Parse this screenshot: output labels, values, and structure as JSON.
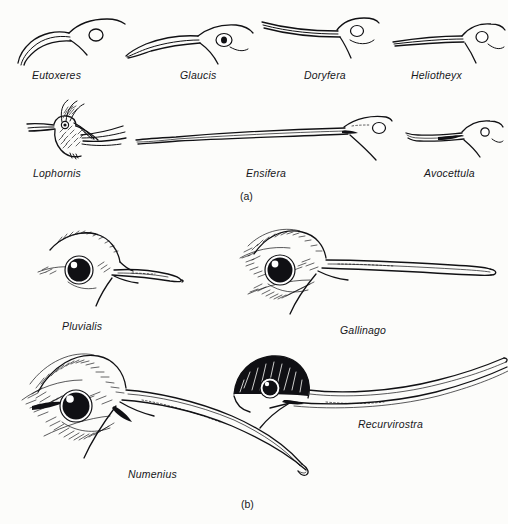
{
  "figure": {
    "background_color": "#fcfcfa",
    "ink_color": "#111114",
    "panels": [
      {
        "id": "a",
        "label": "(a)",
        "subject": "hummingbird bills"
      },
      {
        "id": "b",
        "label": "(b)",
        "subject": "shorebird bills"
      }
    ]
  },
  "panel_a": {
    "label": "(a)",
    "specimens": [
      {
        "name": "Eutoxeres",
        "bill_shape": "strongly decurved sickle",
        "row": 1,
        "col": 1
      },
      {
        "name": "Glaucis",
        "bill_shape": "moderately decurved",
        "row": 1,
        "col": 2
      },
      {
        "name": "Doryfera",
        "bill_shape": "straight upturned lance",
        "row": 1,
        "col": 3
      },
      {
        "name": "Heliotheyx",
        "bill_shape": "straight slender",
        "row": 1,
        "col": 4
      },
      {
        "name": "Lophornis",
        "bill_shape": "short straight, whole bird shown",
        "row": 2,
        "col": 1
      },
      {
        "name": "Ensifera",
        "bill_shape": "extremely elongated sword",
        "row": 2,
        "col": 2
      },
      {
        "name": "Avocettula",
        "bill_shape": "short recurved avocet-like",
        "row": 2,
        "col": 3
      }
    ]
  },
  "panel_b": {
    "label": "(b)",
    "specimens": [
      {
        "name": "Pluvialis",
        "bill_shape": "short stout plover bill",
        "row": 1,
        "col": 1
      },
      {
        "name": "Gallinago",
        "bill_shape": "long straight probing bill",
        "row": 1,
        "col": 2
      },
      {
        "name": "Numenius",
        "bill_shape": "long decurved curlew bill",
        "row": 2,
        "col": 1
      },
      {
        "name": "Recurvirostra",
        "bill_shape": "long recurved avocet bill",
        "row": 2,
        "col": 2
      }
    ]
  }
}
